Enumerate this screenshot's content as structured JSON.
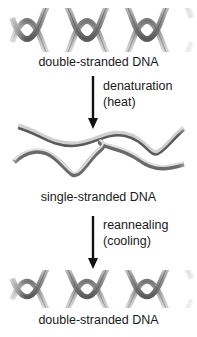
{
  "diagram": {
    "stages": [
      {
        "id": "top",
        "label": "double-stranded DNA",
        "icon": "double-helix-icon"
      },
      {
        "id": "middle",
        "label": "single-stranded DNA",
        "icon": "single-strands-icon"
      },
      {
        "id": "bottom",
        "label": "double-stranded DNA",
        "icon": "double-helix-icon"
      }
    ],
    "transitions": [
      {
        "line1": "denaturation",
        "line2": "(heat)",
        "icon": "down-arrow-icon"
      },
      {
        "line1": "reannealing",
        "line2": "(cooling)",
        "icon": "down-arrow-icon"
      }
    ],
    "colors": {
      "text": "#1a1a1a",
      "strand_dark": "#5a5a5a",
      "strand_light": "#d8d8d8",
      "arrow": "#111111"
    }
  }
}
